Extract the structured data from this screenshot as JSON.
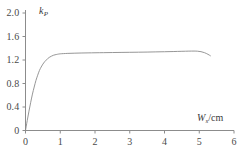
{
  "chart_data": {
    "type": "line",
    "title": "",
    "xlabel": "Ws/cm",
    "ylabel": "kP",
    "xlabel_symbol": "W",
    "xlabel_subscript": "s",
    "xlabel_unit": "/cm",
    "ylabel_symbol": "k",
    "ylabel_subscript": "P",
    "ylabel_unit": "",
    "xlim": [
      0,
      6
    ],
    "ylim": [
      0,
      2.0
    ],
    "xticks": [
      0,
      1,
      2,
      3,
      4,
      5,
      6
    ],
    "xtick_labels": [
      "0",
      "1",
      "2",
      "3",
      "4",
      "5",
      "6"
    ],
    "yticks": [
      0,
      0.4,
      0.8,
      1.2,
      1.6,
      2.0
    ],
    "ytick_labels": [
      "0",
      "0.4",
      "0.8",
      "1.2",
      "1.6",
      "2.0"
    ],
    "grid": false,
    "legend": false,
    "legend_position": "none",
    "line_color": "#8a8a8a",
    "line_width": 0.9,
    "axis_color": "#8c8c8c",
    "series": [
      {
        "name": "kP",
        "x": [
          0.0,
          0.05,
          0.1,
          0.15,
          0.2,
          0.25,
          0.3,
          0.35,
          0.4,
          0.45,
          0.5,
          0.55,
          0.6,
          0.65,
          0.7,
          0.8,
          0.9,
          1.0,
          1.2,
          1.4,
          1.6,
          1.8,
          2.0,
          2.25,
          2.5,
          2.75,
          3.0,
          3.25,
          3.5,
          3.75,
          4.0,
          4.25,
          4.5,
          4.7,
          4.85,
          4.95,
          5.05,
          5.15,
          5.25,
          5.32
        ],
        "y": [
          0.0,
          0.17,
          0.33,
          0.48,
          0.62,
          0.74,
          0.85,
          0.94,
          1.02,
          1.08,
          1.13,
          1.17,
          1.2,
          1.23,
          1.25,
          1.28,
          1.295,
          1.305,
          1.312,
          1.316,
          1.319,
          1.321,
          1.323,
          1.325,
          1.327,
          1.329,
          1.331,
          1.333,
          1.335,
          1.338,
          1.341,
          1.344,
          1.348,
          1.351,
          1.352,
          1.35,
          1.342,
          1.325,
          1.297,
          1.272
        ]
      }
    ],
    "annotations": []
  },
  "caption": {
    "text": ""
  }
}
